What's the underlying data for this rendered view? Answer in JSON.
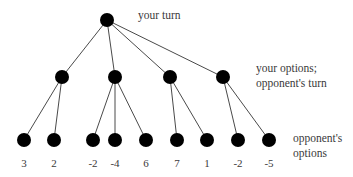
{
  "figure": {
    "width": 353,
    "height": 177,
    "background_color": "#ffffff",
    "node_color": "#000000",
    "edge_color": "#4a4a4a",
    "text_color": "#3a3a3a",
    "node_radius": 7,
    "value_font_size": 11,
    "value_baseline_y": 167
  },
  "labels": {
    "root_label": "your turn",
    "level2_label_line1": "your options;",
    "level2_label_line2": "opponent's turn",
    "leaves_label_line1": "opponent's",
    "leaves_label_line2": "options"
  },
  "tree": {
    "root": {
      "x": 107,
      "y": 20
    },
    "parents": [
      {
        "x": 62,
        "y": 77
      },
      {
        "x": 115,
        "y": 77
      },
      {
        "x": 170,
        "y": 77
      },
      {
        "x": 223,
        "y": 77
      }
    ],
    "leaves": [
      {
        "x": 24,
        "y": 140,
        "parent": 0,
        "value": "3"
      },
      {
        "x": 54,
        "y": 140,
        "parent": 0,
        "value": "2"
      },
      {
        "x": 93,
        "y": 140,
        "parent": 1,
        "value": "-2"
      },
      {
        "x": 115,
        "y": 140,
        "parent": 1,
        "value": "-4"
      },
      {
        "x": 146,
        "y": 140,
        "parent": 1,
        "value": "6"
      },
      {
        "x": 177,
        "y": 140,
        "parent": 2,
        "value": "7"
      },
      {
        "x": 207,
        "y": 140,
        "parent": 2,
        "value": "1"
      },
      {
        "x": 238,
        "y": 140,
        "parent": 3,
        "value": "-2"
      },
      {
        "x": 269,
        "y": 140,
        "parent": 3,
        "value": "-5"
      }
    ]
  }
}
